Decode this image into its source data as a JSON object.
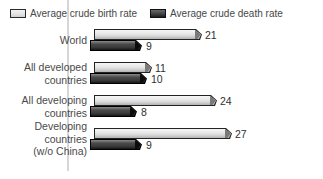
{
  "legend": {
    "items": [
      {
        "label": "Average crude birth rate",
        "swatch_color": "#e2e2e2"
      },
      {
        "label": "Average crude death rate",
        "swatch_color": "#3f3f3f"
      }
    ]
  },
  "chart_data": {
    "type": "bar",
    "orientation": "horizontal",
    "style": "3d-beveled-bars",
    "title": "",
    "categories": [
      "World",
      "All developed\ncountries",
      "All developing\ncountries",
      "Developing\ncountries\n(w/o China)"
    ],
    "series": [
      {
        "name": "Average crude birth rate",
        "color": "#e2e2e2",
        "values": [
          21,
          11,
          24,
          27
        ]
      },
      {
        "name": "Average crude death rate",
        "color": "#3f3f3f",
        "values": [
          9,
          10,
          8,
          9
        ]
      }
    ],
    "data_labels": true,
    "legend_position": "top",
    "x_axis": {
      "ticks_visible": false
    },
    "gridline_color": "#d6d6d6"
  }
}
